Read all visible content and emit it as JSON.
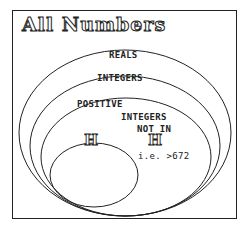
{
  "title": "All Numbers",
  "sets": [
    {
      "label": "REALS"
    },
    {
      "label": "INTEGERS"
    },
    {
      "label": "POSITIVE"
    },
    {
      "label": "H"
    }
  ],
  "complement": {
    "line1": "INTEGERS",
    "line2": "NOT IN",
    "symbol": "H",
    "note": "i.e. >672"
  },
  "colors": {
    "stroke": "#222222",
    "background": "#ffffff"
  }
}
